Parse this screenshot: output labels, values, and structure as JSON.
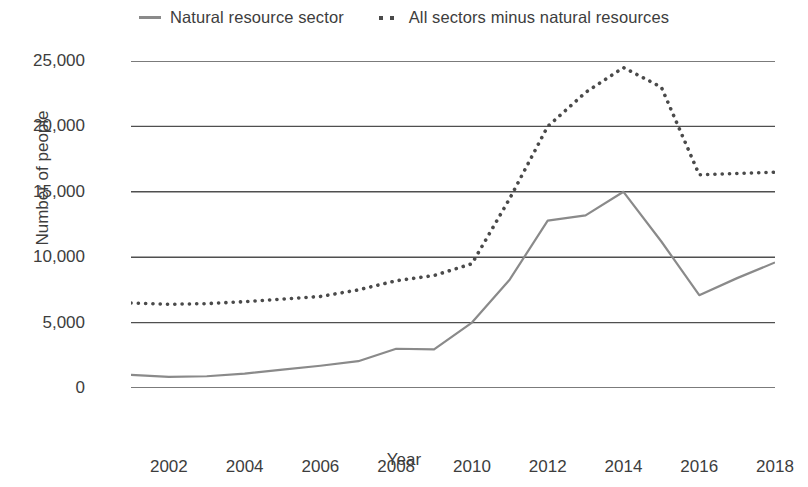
{
  "chart_data": {
    "type": "line",
    "title": "",
    "xlabel": "Year",
    "ylabel": "Number of people",
    "x": [
      2001,
      2002,
      2003,
      2004,
      2005,
      2006,
      2007,
      2008,
      2009,
      2010,
      2011,
      2012,
      2013,
      2014,
      2015,
      2016,
      2017,
      2018
    ],
    "xlim": [
      2001,
      2018
    ],
    "ylim": [
      0,
      25000
    ],
    "ytick_values": [
      0,
      5000,
      10000,
      15000,
      20000,
      25000
    ],
    "ytick_labels": [
      "0",
      "5,000",
      "10,000",
      "15,000",
      "20,000",
      "25,000"
    ],
    "xtick_values": [
      2002,
      2004,
      2006,
      2008,
      2010,
      2012,
      2014,
      2016,
      2018
    ],
    "xtick_labels": [
      "2002",
      "2004",
      "2006",
      "2008",
      "2010",
      "2012",
      "2014",
      "2016",
      "2018"
    ],
    "grid": "horizontal",
    "legend_position": "top-center",
    "series": [
      {
        "name": "Natural resource sector",
        "style": "solid",
        "color": "#8a8a8a",
        "values": [
          1000,
          850,
          900,
          1100,
          1400,
          1700,
          2050,
          3000,
          2950,
          5000,
          8300,
          12800,
          13200,
          15000,
          11200,
          7100,
          8400,
          9600
        ]
      },
      {
        "name": "All sectors minus natural resources",
        "style": "dotted",
        "color": "#4a4a4a",
        "values": [
          6500,
          6400,
          6450,
          6600,
          6800,
          7000,
          7500,
          8200,
          8600,
          9500,
          14500,
          20000,
          22600,
          24500,
          23000,
          16300,
          16400,
          16500
        ]
      }
    ]
  },
  "legend": {
    "items": [
      {
        "label": "Natural resource sector",
        "marker": "solid-line-swatch"
      },
      {
        "label": "All sectors minus natural resources",
        "marker": "dotted-line-swatch"
      }
    ]
  },
  "axes": {
    "y_title": "Number of people",
    "x_title": "Year"
  }
}
